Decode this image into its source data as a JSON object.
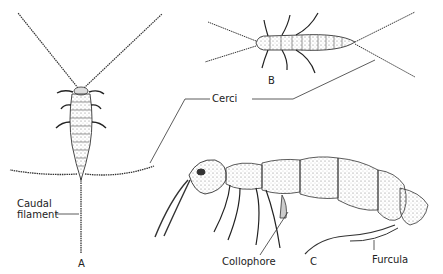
{
  "figure": {
    "labels": {
      "a": "A",
      "b": "B",
      "c": "C",
      "cerci": "Cerci",
      "caudal_line1": "Caudal",
      "caudal_line2": "filament",
      "collophore": "Collophore",
      "furcula": "Furcula"
    },
    "specimens": [
      {
        "id": "A",
        "description": "Bristletail, dorsal view with antennae, cerci and caudal filament"
      },
      {
        "id": "B",
        "description": "Two-pronged bristletail, dorsal view with cerci"
      },
      {
        "id": "C",
        "description": "Springtail, lateral view with collophore and furcula"
      }
    ],
    "colors": {
      "ink": "#222222",
      "shade": "#888888",
      "background": "#ffffff"
    }
  }
}
